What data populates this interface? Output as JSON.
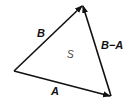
{
  "diagram": {
    "type": "vector-triangle",
    "vertices": {
      "origin": [
        14,
        71
      ],
      "top": [
        83,
        5
      ],
      "bottom_right": [
        111,
        96
      ]
    },
    "vectors": [
      {
        "label": "B",
        "from": "origin",
        "to": "top"
      },
      {
        "label": "A",
        "from": "origin",
        "to": "bottom_right"
      },
      {
        "label": "B−A",
        "from": "bottom_right",
        "to": "top"
      }
    ],
    "area_label": "S",
    "colors": {
      "line": "#111111",
      "background": "#ffffff"
    }
  },
  "labels": {
    "b": "B",
    "a": "A",
    "b_minus_a": "B−A",
    "s": "S"
  }
}
